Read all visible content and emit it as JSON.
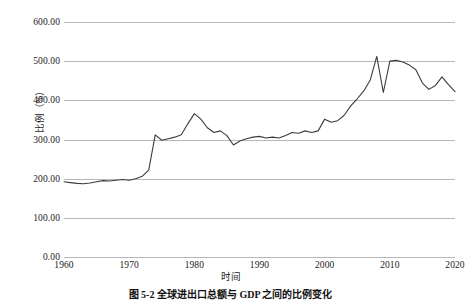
{
  "figure": {
    "caption": "图 5-2  全球进出口总额与 GDP 之间的比例变化"
  },
  "chart_data": {
    "type": "line",
    "title": "",
    "xlabel": "时间",
    "ylabel": "比例（%）",
    "xlim": [
      1960,
      2020
    ],
    "ylim": [
      0,
      600
    ],
    "grid": true,
    "legend": "none",
    "series_color": "#3c3c3c",
    "grid_color": "#b7b7b7",
    "y_ticks": [
      0,
      100,
      200,
      300,
      400,
      500,
      600
    ],
    "y_tick_labels": [
      "0.00",
      "100.00",
      "200.00",
      "300.00",
      "400.00",
      "500.00",
      "600.00"
    ],
    "x_ticks": [
      1960,
      1970,
      1980,
      1990,
      2000,
      2010,
      2020
    ],
    "x_tick_labels": [
      "1960",
      "1970",
      "1980",
      "1990",
      "2000",
      "2010",
      "2020"
    ],
    "x": [
      1960,
      1961,
      1962,
      1963,
      1964,
      1965,
      1966,
      1967,
      1968,
      1969,
      1970,
      1971,
      1972,
      1973,
      1974,
      1975,
      1976,
      1977,
      1978,
      1979,
      1980,
      1981,
      1982,
      1983,
      1984,
      1985,
      1986,
      1987,
      1988,
      1989,
      1990,
      1991,
      1992,
      1993,
      1994,
      1995,
      1996,
      1997,
      1998,
      1999,
      2000,
      2001,
      2002,
      2003,
      2004,
      2005,
      2006,
      2007,
      2008,
      2009,
      2010,
      2011,
      2012,
      2013,
      2014,
      2015,
      2016,
      2017,
      2018,
      2019,
      2020
    ],
    "values": [
      192,
      190,
      188,
      187,
      189,
      192,
      195,
      194,
      196,
      198,
      196,
      200,
      206,
      222,
      312,
      298,
      302,
      306,
      312,
      340,
      366,
      352,
      330,
      318,
      322,
      310,
      286,
      296,
      302,
      306,
      308,
      304,
      306,
      304,
      310,
      318,
      316,
      322,
      318,
      322,
      352,
      344,
      348,
      362,
      386,
      404,
      424,
      452,
      512,
      420,
      500,
      502,
      498,
      490,
      478,
      444,
      428,
      438,
      460,
      440,
      422
    ],
    "annotations": []
  }
}
